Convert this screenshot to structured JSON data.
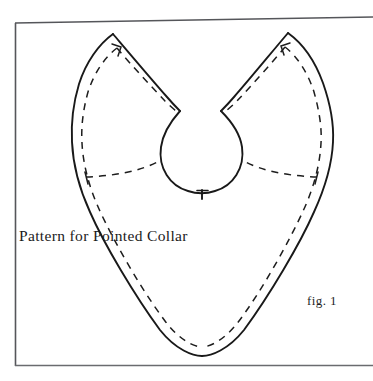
{
  "figure": {
    "caption": "Pattern for Pointed Collar",
    "figure_label": "fig. 1",
    "kind": "sewing-pattern-diagram",
    "subject": "Pointed Collar",
    "background_color": "#ffffff",
    "ink_color": "#1b1b1b",
    "frame": {
      "name": "page-border",
      "style": "thin rectangular rule",
      "color": "#55565a",
      "left": 15,
      "top": 23,
      "right": 373,
      "bottom": 366,
      "top_edge_slant_px": -4,
      "right_edge_visible": false
    },
    "lines": {
      "cutting_line_label": "solid outline",
      "seam_line_label": "dashed stitching line",
      "seam_dash_pattern": "7 6",
      "solid_stroke_width": 1.9,
      "dashed_stroke_width": 1.5
    },
    "shape": {
      "name": "pointed collar pattern",
      "description": "Heart-shaped collar with two upswept pointed wings, a central round neck opening, and a deep V point at the bottom.",
      "left_wing_tip": [
        113,
        34
      ],
      "right_wing_tip": [
        288,
        33
      ],
      "bottom_point": [
        202,
        356
      ],
      "left_extreme_x": 72,
      "right_extreme_x": 334,
      "neck_center": [
        200,
        150
      ],
      "neck_radius": 41,
      "center_notch_tick": [
        202,
        192
      ]
    },
    "marks": [
      {
        "name": "notch-tick-center-front",
        "type": "tick",
        "x": 202,
        "y": 192
      },
      {
        "name": "corner-tick-left-wing",
        "type": "corner-tick",
        "x": 117,
        "y": 48
      },
      {
        "name": "corner-tick-right-wing",
        "type": "corner-tick",
        "x": 285,
        "y": 47
      },
      {
        "name": "balance-tick-left-seam",
        "type": "cross-tick",
        "x": 99,
        "y": 182
      },
      {
        "name": "balance-tick-right-seam",
        "type": "cross-tick",
        "x": 312,
        "y": 182
      }
    ]
  }
}
